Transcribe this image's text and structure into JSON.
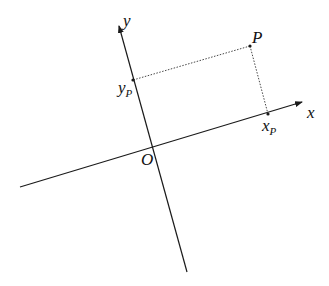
{
  "diagram": {
    "colors": {
      "line": "#1a1a1a",
      "dotted": "#333333",
      "background": "#ffffff"
    },
    "labels": {
      "x_axis": "x",
      "y_axis": "y",
      "origin": "O",
      "point": "P",
      "x_proj_main": "x",
      "x_proj_sub": "P",
      "y_proj_main": "y",
      "y_proj_sub": "P"
    }
  }
}
